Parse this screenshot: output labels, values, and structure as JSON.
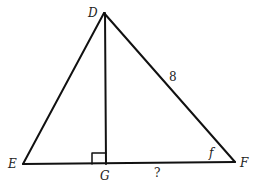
{
  "diagram": {
    "type": "triangle with altitude",
    "vertices": {
      "D": {
        "label": "D",
        "x": 104,
        "y": 13
      },
      "E": {
        "label": "E",
        "x": 23,
        "y": 164
      },
      "F": {
        "label": "F",
        "x": 235,
        "y": 163
      },
      "G": {
        "label": "G",
        "x": 105,
        "y": 164
      }
    },
    "segments": [
      {
        "from": "D",
        "to": "E"
      },
      {
        "from": "D",
        "to": "F"
      },
      {
        "from": "E",
        "to": "F"
      },
      {
        "from": "D",
        "to": "G"
      }
    ],
    "right_angle_at": "G",
    "side_label_DF": "8",
    "angle_label_F": "f",
    "unknown_label_GF": "?"
  }
}
